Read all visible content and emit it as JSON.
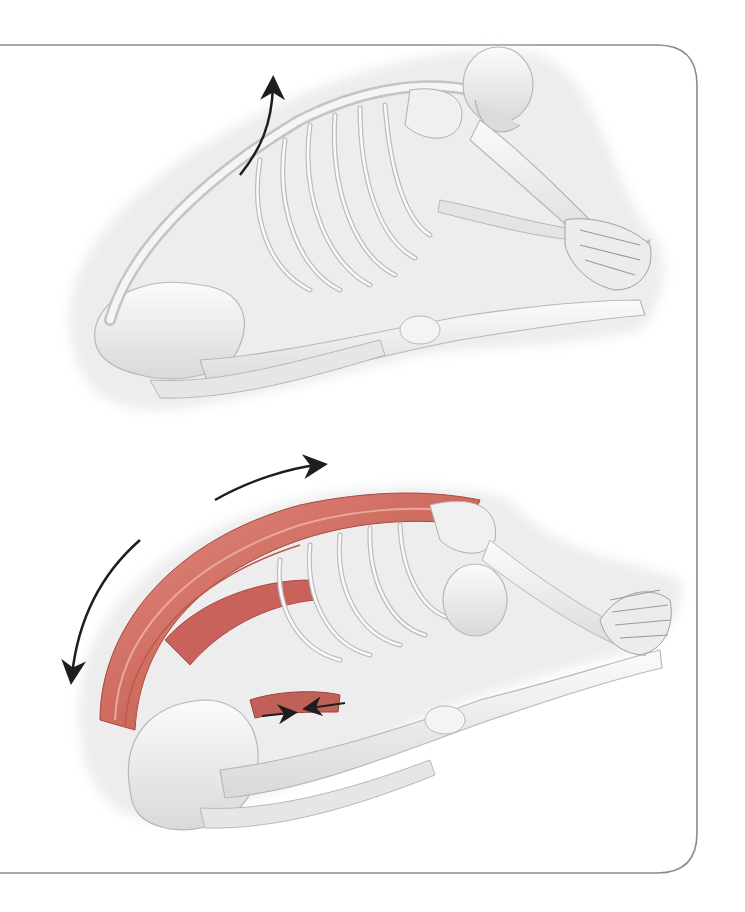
{
  "illustration": {
    "subject": "Seated forward bend skeleton (two views)",
    "panel": {
      "border_color": "#8a8a8a",
      "corner_radius": 40
    },
    "colors": {
      "bone": "#f1f1f1",
      "bone_shade": "#d4d4d4",
      "bone_outline": "#b8b8b8",
      "muscle": "#cf6a5e",
      "muscle_dark": "#a84a40",
      "muscle_light": "#e59a8f",
      "shadow_halo": "#ececec",
      "arrow": "#1e1e1e"
    },
    "figures": [
      {
        "id": "top",
        "label": "skeleton-forward-bend-bones-only",
        "arrows": [
          "spine-lengthening-arrow"
        ]
      },
      {
        "id": "bottom",
        "label": "skeleton-forward-bend-with-back-muscles",
        "arrows": [
          "upper-back-arc-arrow",
          "lower-back-arc-arrow",
          "hamstring-contraction-arrows"
        ]
      }
    ]
  }
}
